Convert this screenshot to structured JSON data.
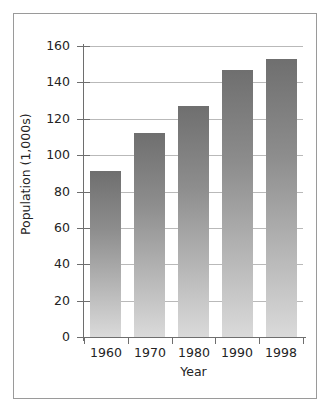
{
  "chart_data": {
    "type": "bar",
    "title": "",
    "subtitle": "",
    "xlabel": "Year",
    "ylabel": "Population (1,000s)",
    "categories": [
      "1960",
      "1970",
      "1980",
      "1990",
      "1998"
    ],
    "values": [
      91,
      112,
      127,
      147,
      153
    ],
    "series": [
      {
        "name": "Population",
        "values": [
          91,
          112,
          127,
          147,
          153
        ]
      }
    ],
    "ylim": [
      0,
      160
    ],
    "ytick_labels": [
      "0",
      "20",
      "40",
      "60",
      "80",
      "100",
      "120",
      "140",
      "160"
    ],
    "ytick_values": [
      0,
      20,
      40,
      60,
      80,
      100,
      120,
      140,
      160
    ],
    "grid": "horizontal",
    "legend": "none",
    "bar_fill": "vertical gradient dark-gray to light-gray",
    "colors": {
      "bar_top": "#6f6f6f",
      "bar_bottom": "#dadada",
      "gridline": "#b9b9b9",
      "axis": "#6e6e6e",
      "text": "#232323",
      "frame": "#9a9a9a",
      "background": "#ffffff"
    }
  }
}
